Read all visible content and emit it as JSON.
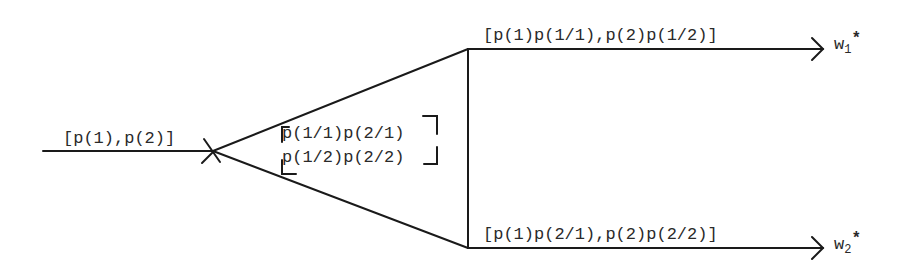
{
  "diagram": {
    "type": "channel-flow",
    "input": {
      "label": "[p(1),p(2)]"
    },
    "channel_matrix": {
      "row1": "p(1/1)p(2/1)",
      "row2": "p(1/2)p(2/2)"
    },
    "outputs": [
      {
        "label": "[p(1)p(1/1),p(2)p(1/2)]",
        "target_base": "w",
        "target_sub": "1",
        "target_sup": "*"
      },
      {
        "label": "[p(1)p(2/1),p(2)p(2/2)]",
        "target_base": "w",
        "target_sub": "2",
        "target_sup": "*"
      }
    ],
    "colors": {
      "line": "#1a1a1a",
      "text": "#2a2a2a",
      "background": "#ffffff"
    }
  }
}
